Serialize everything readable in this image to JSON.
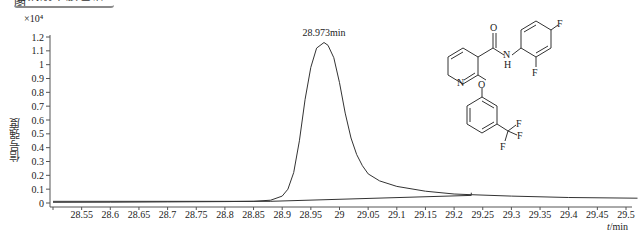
{
  "header": {
    "title_cropped": "吡氟酰草胺色谱图"
  },
  "chart_data": {
    "type": "line",
    "title": "",
    "xlabel": "t/min",
    "ylabel": "信号强度",
    "y_multiplier": "×10⁴",
    "xlim": [
      28.5,
      29.52
    ],
    "ylim": [
      0,
      1.2
    ],
    "x_ticks": [
      "28.55",
      "28.6",
      "28.65",
      "28.7",
      "28.75",
      "28.8",
      "28.85",
      "28.9",
      "28.95",
      "29",
      "29.05",
      "29.1",
      "29.15",
      "29.2",
      "29.25",
      "29.3",
      "29.35",
      "29.4",
      "29.45",
      "29.5"
    ],
    "y_ticks": [
      "0",
      "0.1",
      "0.2",
      "0.3",
      "0.4",
      "0.5",
      "0.6",
      "0.7",
      "0.8",
      "0.9",
      "1",
      "1.1",
      "1.2"
    ],
    "grid": false,
    "series": [
      {
        "name": "chromatogram",
        "x": [
          28.5,
          28.6,
          28.7,
          28.8,
          28.85,
          28.88,
          28.9,
          28.91,
          28.92,
          28.93,
          28.94,
          28.95,
          28.96,
          28.973,
          28.98,
          28.99,
          29.0,
          29.01,
          29.02,
          29.03,
          29.04,
          29.05,
          29.07,
          29.1,
          29.15,
          29.2,
          29.23,
          29.3,
          29.4,
          29.52
        ],
        "y": [
          0.005,
          0.006,
          0.008,
          0.01,
          0.012,
          0.02,
          0.05,
          0.1,
          0.22,
          0.45,
          0.75,
          0.98,
          1.12,
          1.16,
          1.14,
          1.05,
          0.87,
          0.65,
          0.47,
          0.35,
          0.27,
          0.21,
          0.16,
          0.12,
          0.085,
          0.065,
          0.06,
          0.05,
          0.04,
          0.035
        ]
      },
      {
        "name": "integration-baseline",
        "x": [
          28.88,
          29.23
        ],
        "y": [
          0.012,
          0.055
        ]
      }
    ],
    "annotations": [
      {
        "text": "28.973min",
        "x": 28.973,
        "y": 1.16,
        "type": "peak-retention-time"
      }
    ],
    "inset": {
      "type": "chemical-structure",
      "name": "diflufenican",
      "labels": [
        "O",
        "N",
        "H",
        "F",
        "F",
        "N",
        "O",
        "F",
        "F",
        "F"
      ]
    }
  }
}
